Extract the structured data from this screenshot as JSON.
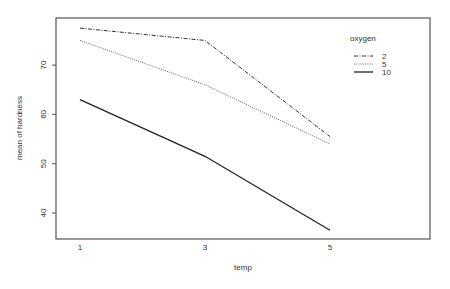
{
  "chart_data": {
    "type": "line",
    "title": "",
    "xlabel": "temp",
    "ylabel": "mean of hardness",
    "x": [
      1,
      3,
      5
    ],
    "xticks": [
      "1",
      "3",
      "5"
    ],
    "yticks": [
      "40",
      "50",
      "60",
      "70"
    ],
    "ylim": [
      35,
      80
    ],
    "grid": false,
    "legend": {
      "title": "oxygen",
      "position": "top-right-inside",
      "entries": [
        "2",
        "5",
        "10"
      ]
    },
    "series": [
      {
        "name": "2",
        "line_style": "dashdot",
        "values": [
          77.5,
          75.0,
          55.5
        ]
      },
      {
        "name": "5",
        "line_style": "dotted",
        "values": [
          75.0,
          66.0,
          54.0
        ]
      },
      {
        "name": "10",
        "line_style": "solid",
        "values": [
          63.0,
          51.5,
          36.5
        ]
      }
    ]
  },
  "colors": {
    "axis": "#555555",
    "line": "#333333",
    "background": "#ffffff"
  }
}
